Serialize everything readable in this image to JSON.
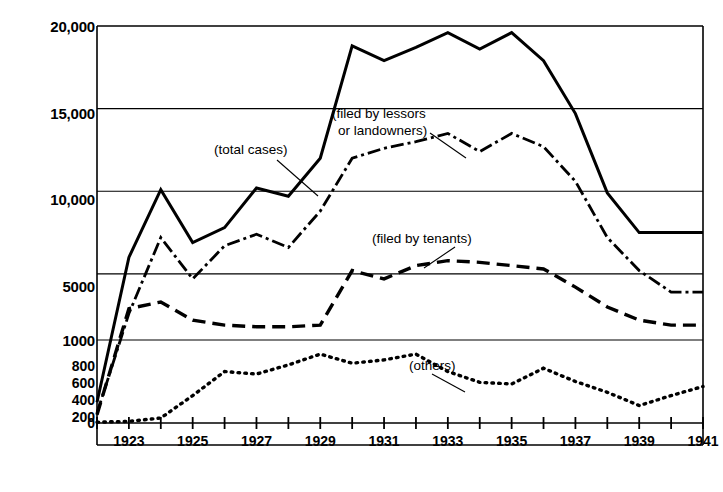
{
  "chart_data": {
    "type": "line",
    "title": "",
    "xlabel": "",
    "ylabel": "",
    "grid": true,
    "legend_position": "inline-annotations",
    "axis_note": "Broken y-axis: upper band linear 1000-20000, lower band linear 0-1000",
    "x": [
      1922,
      1923,
      1924,
      1925,
      1926,
      1927,
      1928,
      1929,
      1930,
      1931,
      1932,
      1933,
      1934,
      1935,
      1936,
      1937,
      1938,
      1939,
      1940,
      1941
    ],
    "xticks_labeled": [
      "1923",
      "1925",
      "1927",
      "1929",
      "1931",
      "1933",
      "1935",
      "1937",
      "1939",
      "1941"
    ],
    "yticks_upper": [
      "20,000",
      "15,000",
      "10,000",
      "5000",
      "1000"
    ],
    "yticks_lower": [
      "800",
      "600",
      "400",
      "200",
      "0"
    ],
    "ylim_upper": [
      1000,
      20000
    ],
    "ylim_lower": [
      0,
      1000
    ],
    "series": [
      {
        "name": "total cases",
        "style": "solid",
        "scale": "upper",
        "values": [
          250,
          6000,
          10100,
          6900,
          7800,
          10200,
          9700,
          12000,
          18800,
          17900,
          18700,
          19600,
          18600,
          19600,
          17900,
          14700,
          9900,
          7500,
          7500,
          7500
        ]
      },
      {
        "name": "filed by lessors or landowners",
        "style": "dash-dot",
        "scale": "upper",
        "values": [
          120,
          2600,
          7200,
          4700,
          6700,
          7400,
          6600,
          8800,
          12000,
          12600,
          13000,
          13500,
          12400,
          13500,
          12700,
          10600,
          7200,
          5200,
          3900,
          3900
        ]
      },
      {
        "name": "filed by tenants",
        "style": "dashed",
        "scale": "upper",
        "values": [
          100,
          2900,
          3300,
          2200,
          1900,
          1800,
          1800,
          1900,
          5200,
          4700,
          5500,
          5800,
          5700,
          5500,
          5300,
          4200,
          3000,
          2200,
          1900,
          1900
        ]
      },
      {
        "name": "others",
        "style": "dotted",
        "scale": "lower",
        "values": [
          10,
          20,
          60,
          330,
          620,
          590,
          700,
          830,
          720,
          760,
          830,
          620,
          490,
          470,
          660,
          500,
          370,
          210,
          330,
          440
        ]
      }
    ],
    "annotations": [
      {
        "name": "total-cases",
        "text": "(total cases)"
      },
      {
        "name": "lessors",
        "text_line1": "(filed by lessors",
        "text_line2": "or landowners)"
      },
      {
        "name": "tenants",
        "text": "(filed by tenants)"
      },
      {
        "name": "others",
        "text": "(others)"
      }
    ]
  }
}
